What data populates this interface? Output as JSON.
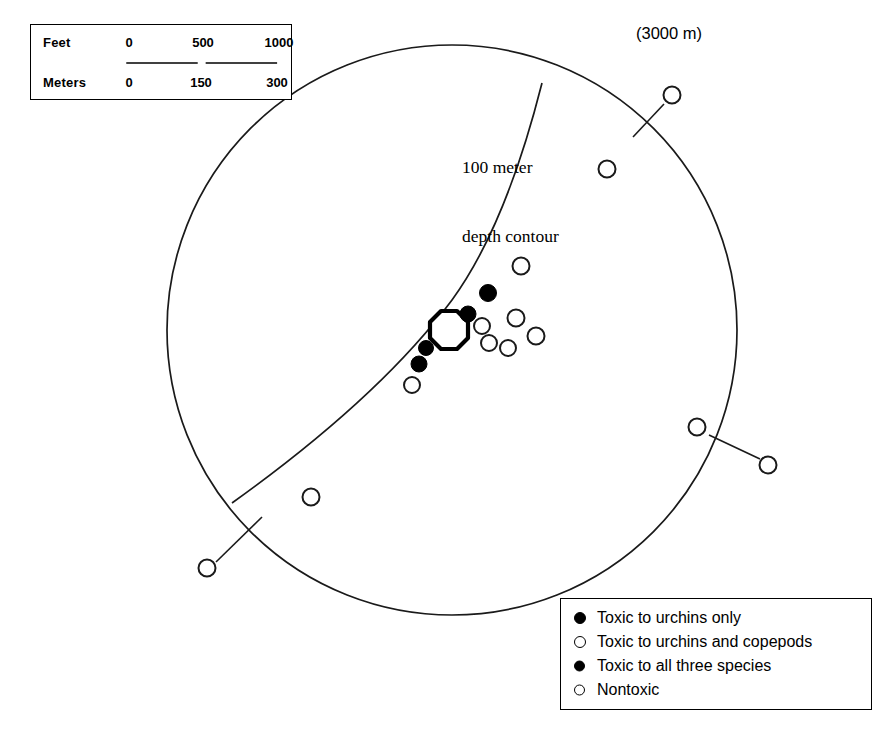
{
  "figure": {
    "type": "map"
  },
  "scale_bar": {
    "rows": [
      {
        "unit_label": "Feet",
        "ticks": [
          "0",
          "500",
          "1000"
        ]
      },
      {
        "unit_label": "Meters",
        "ticks": [
          "0",
          "150",
          "300"
        ]
      }
    ]
  },
  "annotations": {
    "contour_label_line1": "100 meter",
    "contour_label_line2": "depth contour",
    "distance_label": "(3000 m)"
  },
  "legend": {
    "items": [
      {
        "marker": "filled-lg",
        "label": "Toxic to urchins only"
      },
      {
        "marker": "open-lg",
        "label": "Toxic to urchins and copepods"
      },
      {
        "marker": "filled-sm",
        "label": "Toxic to all three species"
      },
      {
        "marker": "open-sm",
        "label": "Nontoxic"
      }
    ]
  },
  "map_data": {
    "boundary_circle": {
      "cx": 452,
      "cy": 330,
      "r": 285
    },
    "outfall_marker": {
      "cx": 449,
      "cy": 329,
      "r": 19,
      "shape": "octagon"
    },
    "depth_contour_path": "M 542 83 C 520 170, 492 245, 452 300 C 400 370, 320 440, 232 503",
    "stations": [
      {
        "id": "s1",
        "cx": 488,
        "cy": 293,
        "r": 8.5,
        "type": "filled"
      },
      {
        "id": "s2",
        "cx": 468,
        "cy": 314,
        "r": 8.0,
        "type": "filled"
      },
      {
        "id": "s3",
        "cx": 482,
        "cy": 326,
        "r": 8.0,
        "type": "open"
      },
      {
        "id": "s4",
        "cx": 489,
        "cy": 343,
        "r": 8.0,
        "type": "open"
      },
      {
        "id": "s5",
        "cx": 426,
        "cy": 348,
        "r": 7.5,
        "type": "filled"
      },
      {
        "id": "s6",
        "cx": 419,
        "cy": 364,
        "r": 8.0,
        "type": "filled"
      },
      {
        "id": "s7",
        "cx": 412,
        "cy": 385,
        "r": 8.0,
        "type": "open"
      },
      {
        "id": "s8",
        "cx": 521,
        "cy": 266,
        "r": 8.5,
        "type": "open"
      },
      {
        "id": "s9",
        "cx": 516,
        "cy": 318,
        "r": 8.5,
        "type": "open"
      },
      {
        "id": "s10",
        "cx": 508,
        "cy": 348,
        "r": 8.0,
        "type": "open"
      },
      {
        "id": "s11",
        "cx": 536,
        "cy": 336,
        "r": 8.5,
        "type": "open"
      },
      {
        "id": "s12",
        "cx": 607,
        "cy": 169,
        "r": 8.5,
        "type": "open"
      },
      {
        "id": "s13",
        "cx": 697,
        "cy": 427,
        "r": 8.5,
        "type": "open"
      },
      {
        "id": "s14",
        "cx": 311,
        "cy": 497,
        "r": 8.5,
        "type": "open"
      },
      {
        "id": "s15",
        "cx": 672,
        "cy": 95,
        "r": 8.5,
        "type": "open"
      },
      {
        "id": "s16",
        "cx": 768,
        "cy": 465,
        "r": 8.5,
        "type": "open"
      },
      {
        "id": "s17",
        "cx": 207,
        "cy": 568,
        "r": 8.5,
        "type": "open"
      }
    ],
    "leader_lines": [
      {
        "id": "l1",
        "x1": 664,
        "y1": 104,
        "x2": 633,
        "y2": 137
      },
      {
        "id": "l2",
        "x1": 760,
        "y1": 459,
        "x2": 709,
        "y2": 435
      },
      {
        "id": "l3",
        "x1": 216,
        "y1": 562,
        "x2": 262,
        "y2": 517
      }
    ]
  }
}
